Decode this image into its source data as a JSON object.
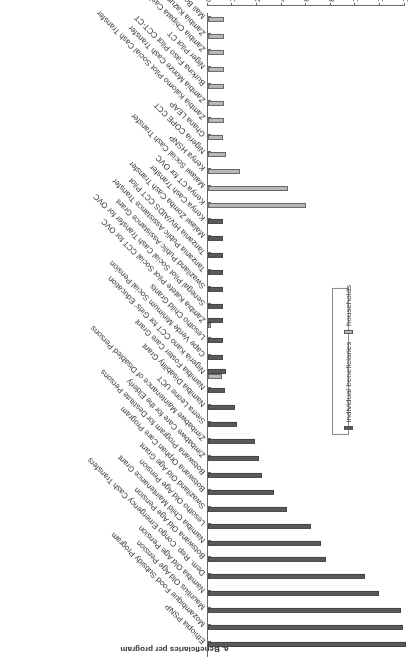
{
  "figure": {
    "title": "a. Beneficiaries per program",
    "axis_label": "thousands of beneficiaries",
    "legend": [
      {
        "label": "individual beneficiaries",
        "color": "#5a5a5a"
      },
      {
        "label": "households",
        "color": "#b8b8b8"
      }
    ],
    "orientation": "rotated 180 degrees"
  },
  "chart_data": {
    "type": "bar",
    "title": "a. Beneficiaries per program",
    "xlabel": "",
    "ylabel": "thousands of beneficiaries",
    "ylim": [
      0,
      140
    ],
    "yticks": [
      0,
      10,
      20,
      40,
      60,
      80,
      100,
      120,
      140
    ],
    "axis_note": "broken scale: 0-20 expanded, 20-140 compressed",
    "grid": false,
    "legend_position": "bottom",
    "categories": [
      "Ethiopia PSNP",
      "Mozambique Food Subsidy Program",
      "Mauritius Old Age Pension",
      "Namibia Old Age Pension",
      "Dem. Rep. Congo Emergency Cash Transfers",
      "Botswana Old Age Pension",
      "Namibia Child Maintenance Grant",
      "Lesotho Old Age Pension",
      "Swaziland Old Age Grant",
      "Botswana Orphan Care Program",
      "Botswana Program for Destitute Persons",
      "Zimbabwe Care for the Elderly",
      "Zimbabwe Maintenance of Disabled Persons",
      "Sierra Leone UCT",
      "Namibia Disability Grant",
      "Namibia Foster Care Grant",
      "Nigeria Kano CCT for Girls' Education",
      "Cape Verde Minimum Social Pension",
      "Lesotho Child Grants",
      "Zambia Katete Pilot Social CCT for OVC",
      "Senegal Pilot Social Cash Transfer for OVC",
      "Swaziland Public Assistance Grant",
      "Tanzania Public Assistance Transfer",
      "Tanzania HIV/AIDS CCT Pilot",
      "Malawi Zomba Cash Transfer",
      "Kenya Cash Transfer",
      "Kenya CT for OVC",
      "Malawi Social Cash Transfer",
      "Kenya HSNP",
      "Nigeria COPE CCT",
      "Ghana LEAP",
      "Zambia Kalomo Pilot Social Cash Transfer",
      "Zambia Monze Cash Transfer",
      "Burkina Faso Pilot CCT-CT",
      "Niger Pilot CT",
      "Zambia Chipata Cash Transfer",
      "Zambia Kazungula Cash Transfer",
      "Mali Bourse Maman"
    ],
    "series": [
      {
        "name": "individual beneficiaries",
        "color": "#5a5a5a",
        "values": [
          141,
          139,
          137,
          119,
          108,
          76,
          72,
          64,
          44,
          34,
          24,
          22,
          19,
          12,
          11,
          7,
          7.5,
          6,
          6,
          6,
          6,
          6,
          6,
          6,
          6,
          6,
          null,
          null,
          null,
          null,
          null,
          null,
          null,
          null,
          null,
          null,
          null,
          null
        ]
      },
      {
        "name": "households",
        "color": "#b8b8b8",
        "values": [
          null,
          null,
          null,
          null,
          null,
          null,
          null,
          null,
          null,
          null,
          null,
          null,
          null,
          null,
          null,
          null,
          5.7,
          null,
          null,
          1.3,
          null,
          null,
          null,
          null,
          null,
          null,
          60,
          45,
          13,
          7.5,
          6.2,
          6.5,
          6.5,
          6.5,
          6.5,
          6.5,
          6.5,
          6.5
        ]
      }
    ]
  }
}
